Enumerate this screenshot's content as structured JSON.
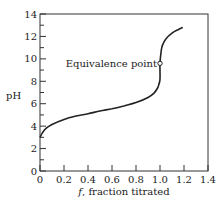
{
  "chart_data": {
    "type": "line",
    "title": "",
    "xlabel_var": "f",
    "xlabel_rest": ", fraction titrated",
    "ylabel": "pH",
    "xlim": [
      0,
      1.4
    ],
    "ylim": [
      0,
      14
    ],
    "x_ticks": [
      "0",
      "0.2",
      "0.4",
      "0.6",
      "0.8",
      "1.0",
      "1.2",
      "1.4"
    ],
    "y_ticks": [
      "0",
      "2",
      "4",
      "6",
      "8",
      "10",
      "12",
      "14"
    ],
    "grid": false,
    "legend": null,
    "series": [
      {
        "name": "titration curve",
        "x": [
          0.0,
          0.02,
          0.05,
          0.1,
          0.2,
          0.3,
          0.4,
          0.5,
          0.6,
          0.7,
          0.8,
          0.9,
          0.95,
          0.98,
          0.99,
          1.0,
          1.0,
          1.01,
          1.02,
          1.05,
          1.1,
          1.15,
          1.19
        ],
        "y": [
          3.0,
          3.4,
          3.8,
          4.15,
          4.6,
          4.9,
          5.1,
          5.35,
          5.55,
          5.8,
          6.1,
          6.55,
          6.95,
          7.4,
          7.7,
          8.2,
          9.6,
          10.7,
          11.2,
          11.8,
          12.3,
          12.6,
          12.8
        ]
      }
    ],
    "annotations": [
      {
        "text": "Equivalence point",
        "x": 1.0,
        "y": 9.6,
        "marker": "open-circle"
      }
    ]
  }
}
